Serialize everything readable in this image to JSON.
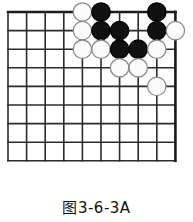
{
  "figure": {
    "caption": "图3-6-3A",
    "kind": "go-board-diagram"
  },
  "board": {
    "columns": 10,
    "rows": 9,
    "origin_x": 8,
    "origin_y": 12,
    "spacing": 18.6,
    "edge_top": true,
    "edge_right": true,
    "line_color": "#2b2b2b",
    "edge_color": "#1a1a1a",
    "line_width": 1.6,
    "edge_width": 2.6,
    "background_color": "#ffffff"
  },
  "stone_style": {
    "radius": 9.2,
    "black_fill": "#111111",
    "black_stroke": "#000000",
    "white_fill": "#fbfbfb",
    "white_stroke": "#8a8a8a",
    "stroke_width": 1.3
  },
  "stones": [
    {
      "color": "white",
      "col": 5,
      "row": 1
    },
    {
      "color": "black",
      "col": 6,
      "row": 1
    },
    {
      "color": "black",
      "col": 9,
      "row": 1
    },
    {
      "color": "white",
      "col": 5,
      "row": 2
    },
    {
      "color": "black",
      "col": 6,
      "row": 2
    },
    {
      "color": "black",
      "col": 7,
      "row": 2
    },
    {
      "color": "black",
      "col": 9,
      "row": 2
    },
    {
      "color": "white",
      "col": 10,
      "row": 2
    },
    {
      "color": "white",
      "col": 5,
      "row": 3
    },
    {
      "color": "white",
      "col": 6,
      "row": 3
    },
    {
      "color": "black",
      "col": 7,
      "row": 3
    },
    {
      "color": "black",
      "col": 8,
      "row": 3
    },
    {
      "color": "white",
      "col": 9,
      "row": 3
    },
    {
      "color": "white",
      "col": 7,
      "row": 4
    },
    {
      "color": "white",
      "col": 8,
      "row": 4
    },
    {
      "color": "white",
      "col": 9,
      "row": 5
    }
  ]
}
